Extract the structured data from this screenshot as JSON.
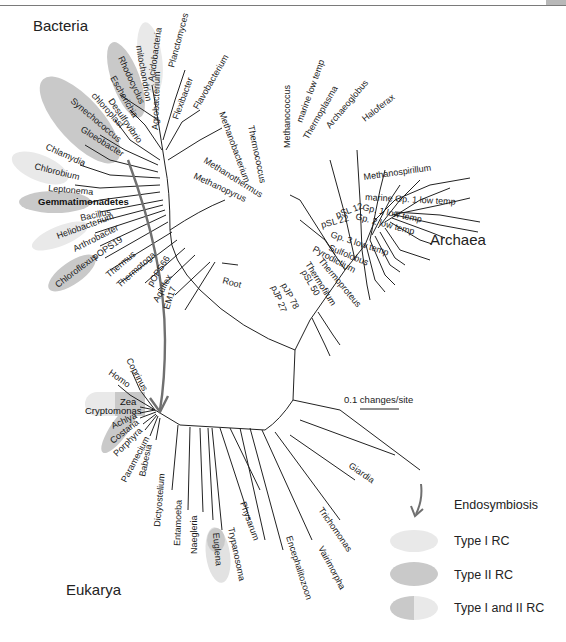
{
  "colors": {
    "type1": "#e9e9e9",
    "type2": "#c9c9c9",
    "arrow": "#707070",
    "branch": "#222222"
  },
  "domains": {
    "bacteria": "Bacteria",
    "archaea": "Archaea",
    "eukarya": "Eukarya"
  },
  "root_label": "Root",
  "scale_bar": {
    "label": "0.1 changes/site"
  },
  "legend": {
    "endosymbiosis": "Endosymbiosis",
    "type1": "Type I RC",
    "type2": "Type II RC",
    "type12": "Type I and II RC"
  },
  "bacteria_taxa": [
    "Acidobacteria",
    "Planctomyces",
    "mitochondrion",
    "Rhodocyclus",
    "Agrobacterium",
    "Flexibacter",
    "Flavobacterium",
    "Escherichia",
    "Desulfovibrio",
    "chloroplast",
    "Synechococcus",
    "Gloeobacter",
    "Chlamydia",
    "Chlorobium",
    "Leptonema",
    "Gemmatimonadetes",
    "Bacillus",
    "Heliobacterium",
    "Arthrobacter",
    "pOPS19",
    "Chloroflexus",
    "Thermus",
    "Thermotoga",
    "pOPS66",
    "Aquifex",
    "EM17"
  ],
  "archaea_taxa": [
    "Methanobacterium",
    "Thermococcus",
    "Methanococcus",
    "marine low temp",
    "Thermoplasma",
    "Archaeoglobus",
    "Haloferax",
    "Methanospirillum",
    "Methanothermus",
    "Methanopyrus",
    "marine Gp. 1 low temp",
    "Gp. 1 low temp",
    "Gp. 2 low temp",
    "pSL 12",
    "pSL 22",
    "Gp. 3 low temp",
    "Sulfolobus",
    "Pyrodictium",
    "Thermoproteus",
    "Thermofilum",
    "pSL 50",
    "pJP 78",
    "pJP 27"
  ],
  "eukarya_taxa": [
    "Coprinus",
    "Homo",
    "Zea",
    "Cryptomonas",
    "Achlya",
    "Costaria",
    "Porphyra",
    "Paramecium",
    "Babesia",
    "Dictyostelium",
    "Entamoeba",
    "Naegleria",
    "Euglena",
    "Trypanosoma",
    "Physarum",
    "Encephalitozoon",
    "Vairimorpha",
    "Trichomonas",
    "Giardia"
  ]
}
